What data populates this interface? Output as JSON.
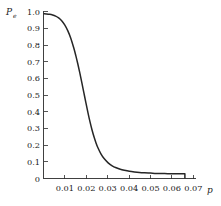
{
  "chart_data": {
    "type": "line",
    "title": "",
    "subtitle": "",
    "xlabel": "p",
    "ylabel": "P",
    "ylabel_subscript": "e",
    "xlim": [
      0.0,
      0.0755
    ],
    "ylim": [
      0.0,
      1.02
    ],
    "grid": false,
    "legend": null,
    "xticks": [
      0.01,
      0.02,
      0.03,
      0.04,
      0.05,
      0.06,
      0.07
    ],
    "xtick_labels": [
      "0.01",
      "0.02",
      "0.03",
      "0.04",
      "0.05",
      "0.06",
      "0.07"
    ],
    "yticks": [
      0,
      0.1,
      0.2,
      0.3,
      0.4,
      0.5,
      0.6,
      0.7,
      0.8,
      0.9,
      1.0
    ],
    "ytick_labels": [
      "0",
      "0.1",
      "0.2",
      "0.3",
      "0.4",
      "0.5",
      "0.6",
      "0.7",
      "0.8",
      "0.9",
      "1.0"
    ],
    "origin_label": "0",
    "series": [
      {
        "name": "Pe",
        "color": "#262626",
        "x": [
          0.0,
          0.0015,
          0.003,
          0.0045,
          0.006,
          0.0075,
          0.009,
          0.0105,
          0.012,
          0.0135,
          0.015,
          0.016,
          0.017,
          0.018,
          0.019,
          0.02,
          0.021,
          0.022,
          0.023,
          0.024,
          0.025,
          0.026,
          0.027,
          0.0285,
          0.03,
          0.032,
          0.034,
          0.036,
          0.038,
          0.04,
          0.0425,
          0.045,
          0.0475,
          0.05,
          0.053,
          0.056,
          0.06,
          0.064,
          0.068,
          0.07
        ],
        "y": [
          1.0,
          0.999,
          0.997,
          0.993,
          0.986,
          0.975,
          0.958,
          0.933,
          0.898,
          0.852,
          0.792,
          0.746,
          0.695,
          0.64,
          0.581,
          0.52,
          0.459,
          0.4,
          0.345,
          0.296,
          0.253,
          0.216,
          0.185,
          0.148,
          0.121,
          0.095,
          0.077,
          0.065,
          0.056,
          0.05,
          0.044,
          0.04,
          0.037,
          0.035,
          0.033,
          0.031,
          0.03,
          0.029,
          0.029,
          0.029
        ],
        "endpoint_drop": true
      }
    ]
  },
  "figure": {
    "background_color": "#ffffff",
    "axis_color": "#2b2b2b",
    "curve_color": "#262626"
  }
}
